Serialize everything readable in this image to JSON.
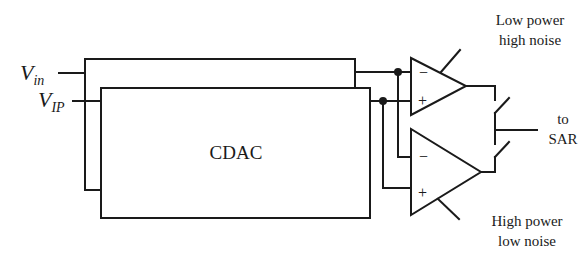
{
  "diagram": {
    "inputs": {
      "vin": {
        "main": "V",
        "sub": "in"
      },
      "vip": {
        "main": "V",
        "sub": "IP"
      }
    },
    "cdac": {
      "label": "CDAC"
    },
    "comparators": [
      {
        "name": "low-power",
        "line1": "Low power",
        "line2": "high noise",
        "minus": "−",
        "plus": "+"
      },
      {
        "name": "high-power",
        "line1": "High power",
        "line2": "low noise",
        "minus": "−",
        "plus": "+"
      }
    ],
    "output": {
      "line1": "to",
      "line2": "SAR"
    },
    "colors": {
      "stroke": "#1a1a1a",
      "background": "#ffffff"
    }
  }
}
